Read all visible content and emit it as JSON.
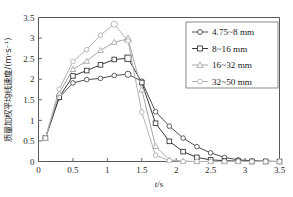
{
  "chart_data": {
    "type": "line",
    "title": "",
    "xlabel": "t/s",
    "ylabel": "质量加权平均线速度/(m·s⁻¹)",
    "xlim": [
      0,
      3.5
    ],
    "ylim": [
      0,
      3.5
    ],
    "xticks": [
      0,
      0.5,
      1,
      1.5,
      2,
      2.5,
      3,
      3.5
    ],
    "xticklabels": [
      "0",
      "0.5",
      "1",
      "1.5",
      "2",
      "2.5",
      "3",
      "3.5"
    ],
    "yticks": [
      0,
      0.5,
      1,
      1.5,
      2,
      2.5,
      3,
      3.5
    ],
    "yticklabels": [
      "0",
      "0.5",
      "1",
      "1.5",
      "2",
      "2.5",
      "3",
      "3.5"
    ],
    "grid": false,
    "legend_position": "top-right",
    "x": [
      0.1,
      0.3,
      0.5,
      0.7,
      0.9,
      1.1,
      1.3,
      1.5,
      1.7,
      1.9,
      2.1,
      2.3,
      2.5,
      2.7,
      2.9,
      3.1,
      3.3,
      3.5
    ],
    "series": [
      {
        "name": "4.75~8 mm",
        "marker": "circle",
        "color": "#4d4d4d",
        "values": [
          0.57,
          1.55,
          1.91,
          1.99,
          2.02,
          2.09,
          2.12,
          1.95,
          1.21,
          0.86,
          0.57,
          0.36,
          0.21,
          0.1,
          0.04,
          0.02,
          0.01,
          0.0
        ]
      },
      {
        "name": "8~16 mm",
        "marker": "square",
        "color": "#3a3a3a",
        "values": [
          0.57,
          1.56,
          2.08,
          2.21,
          2.35,
          2.48,
          2.51,
          1.92,
          0.93,
          0.49,
          0.24,
          0.1,
          0.04,
          0.02,
          0.01,
          0.0,
          0.0,
          0.0
        ]
      },
      {
        "name": "16~32 mm",
        "marker": "triangle",
        "color": "#a6a6a6",
        "values": [
          0.57,
          1.66,
          2.24,
          2.44,
          2.7,
          2.9,
          2.98,
          1.74,
          0.37,
          0.04,
          0.01,
          0.0,
          0.0,
          0.0,
          0.0,
          0.0,
          0.0,
          0.0
        ]
      },
      {
        "name": "32~50 mm",
        "marker": "circle",
        "color": "#b3b3b3",
        "values": [
          0.57,
          1.76,
          2.43,
          2.72,
          3.07,
          3.34,
          2.93,
          1.2,
          0.15,
          0.02,
          0.0,
          0.0,
          0.0,
          0.0,
          0.0,
          0.0,
          0.0,
          0.0
        ]
      }
    ]
  },
  "legend": {
    "items": [
      {
        "label": "4.75~8 mm"
      },
      {
        "label": "8~16 mm"
      },
      {
        "label": "16~32 mm"
      },
      {
        "label": "32~50 mm"
      }
    ]
  }
}
